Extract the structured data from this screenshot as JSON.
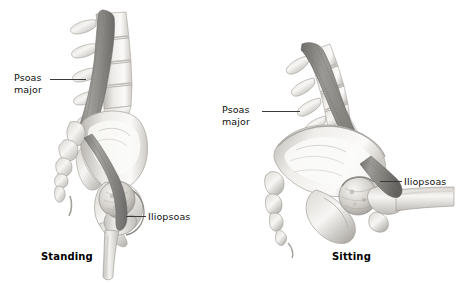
{
  "figure": {
    "background_color": "#ffffff",
    "text_color": "#111111",
    "leader_line_color": "#3a3a3a",
    "bone_light": "#f2f1ef",
    "bone_mid": "#d8d6d2",
    "bone_shadow": "#a9a6a1",
    "muscle_light": "#b9b7b4",
    "muscle_mid": "#8d8b88",
    "muscle_dark": "#6e6c6a"
  },
  "panels": [
    {
      "id": "standing",
      "caption": "Standing",
      "labels": [
        {
          "id": "psoas-major",
          "line1": "Psoas",
          "line2": "major"
        },
        {
          "id": "iliopsoas",
          "line1": "Iliopsoas",
          "line2": ""
        }
      ]
    },
    {
      "id": "sitting",
      "caption": "Sitting",
      "labels": [
        {
          "id": "psoas-major",
          "line1": "Psoas",
          "line2": "major"
        },
        {
          "id": "iliopsoas",
          "line1": "Iliopsoas",
          "line2": ""
        }
      ]
    }
  ]
}
